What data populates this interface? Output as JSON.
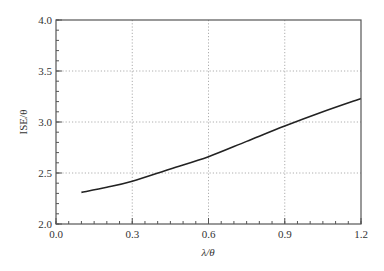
{
  "chart_data": {
    "type": "line",
    "title": "",
    "xlabel": "λ/θ",
    "ylabel": "ISE/θ",
    "xlim": [
      0.0,
      1.2
    ],
    "ylim": [
      2.0,
      4.0
    ],
    "x_ticks": [
      "0.0",
      "0.3",
      "0.6",
      "0.9",
      "1.2"
    ],
    "y_ticks": [
      "2.0",
      "2.5",
      "3.0",
      "3.5",
      "4.0"
    ],
    "x_minor_step": 0.05,
    "y_minor_step": 0.1,
    "grid": true,
    "grid_style": "dotted",
    "legend": null,
    "series": [
      {
        "name": "ISE/θ",
        "color": "#222222",
        "x": [
          0.1,
          0.2,
          0.3,
          0.45,
          0.6,
          0.75,
          0.9,
          1.05,
          1.2
        ],
        "y": [
          2.31,
          2.36,
          2.42,
          2.54,
          2.66,
          2.81,
          2.96,
          3.1,
          3.23
        ]
      }
    ]
  },
  "colors": {
    "axis": "#555555",
    "grid": "#999999",
    "line": "#222222",
    "text": "#333333"
  }
}
